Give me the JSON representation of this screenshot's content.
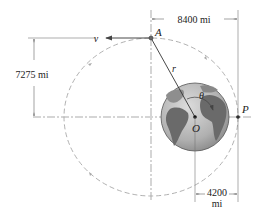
{
  "diagram": {
    "labels": {
      "point_A": "A",
      "point_P": "P",
      "point_O": "O",
      "velocity": "v",
      "radius": "r",
      "angle": "θ"
    },
    "dimensions": {
      "horizontal_A_to_P": "8400 mi",
      "vertical_A_to_axis": "7275 mi",
      "O_to_P_line1": "4200",
      "O_to_P_line2": "mi"
    },
    "colors": {
      "orbit": "#a0a0a0",
      "lines": "#555555",
      "earth_ocean": "#b8b8b8",
      "earth_land": "#6a6a6a",
      "text": "#222222"
    }
  }
}
